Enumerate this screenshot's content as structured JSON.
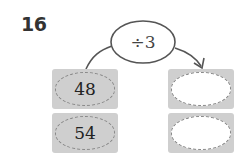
{
  "problem": {
    "number": "16",
    "operation": "÷3",
    "inputs": [
      "48",
      "54"
    ],
    "outputs": [
      "",
      ""
    ]
  }
}
